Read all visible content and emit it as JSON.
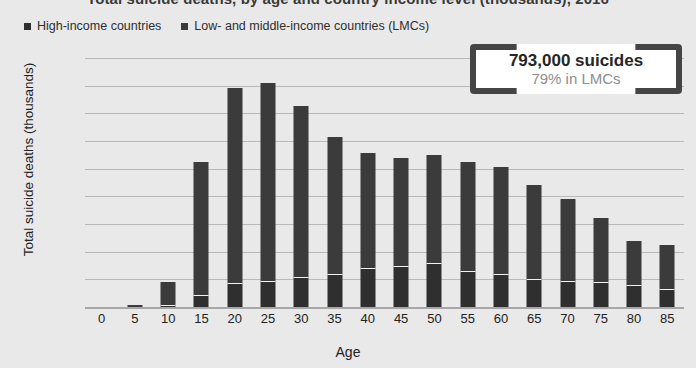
{
  "chart_data": {
    "type": "bar",
    "stacked": true,
    "title": "Total suicide deaths, by age and country income level (thousands), 2016",
    "xlabel": "Age",
    "ylabel": "Total suicide deaths (thousands)",
    "ylim": [
      0,
      90
    ],
    "yticks": [
      90,
      80,
      70,
      60,
      50,
      40,
      30,
      20,
      10,
      0
    ],
    "grid": true,
    "legend_position": "top-left",
    "categories": [
      "0",
      "5",
      "10",
      "15",
      "20",
      "25",
      "30",
      "35",
      "40",
      "45",
      "50",
      "55",
      "60",
      "65",
      "70",
      "75",
      "80",
      "85"
    ],
    "series": [
      {
        "name": "High-income countries",
        "color": "#2f2f2f",
        "values": [
          0,
          0,
          0.8,
          4.5,
          8.5,
          9.5,
          11,
          12,
          14,
          15,
          16,
          13,
          12,
          10,
          9.5,
          9,
          8,
          6.5
        ]
      },
      {
        "name": "Low- and middle-income countries (LMCs)",
        "color": "#3b3b3b",
        "values": [
          0,
          0.8,
          8.2,
          48,
          70.5,
          71.5,
          61.5,
          49.5,
          41.5,
          39,
          39,
          39.5,
          38.5,
          34,
          29.5,
          23,
          16,
          16
        ]
      }
    ],
    "totals": [
      0,
      0.8,
      9,
      52.5,
      79,
      81,
      72.5,
      61.5,
      55.5,
      54,
      55,
      52.5,
      50.5,
      44,
      39,
      32,
      24,
      22.5
    ],
    "annotation": {
      "main": "793,000 suicides",
      "sub": "79% in LMCs"
    }
  },
  "legend": {
    "items": [
      {
        "label": "High-income countries",
        "color": "#2f2f2f"
      },
      {
        "label": "Low- and middle-income countries (LMCs)",
        "color": "#3b3b3b"
      }
    ]
  }
}
